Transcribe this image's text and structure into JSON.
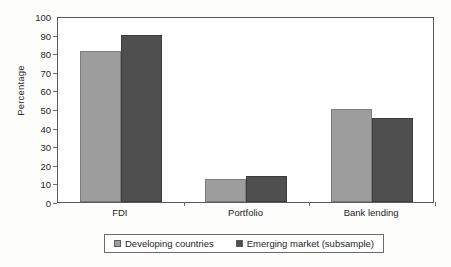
{
  "chart_data": {
    "type": "bar",
    "title": "",
    "subtitle": "",
    "xlabel": "",
    "ylabel": "Percentage",
    "categories": [
      "FDI",
      "Portfolio",
      "Bank lending"
    ],
    "series": [
      {
        "name": "Developing countries",
        "color": "#9d9d9d",
        "values": [
          81,
          12.5,
          50
        ]
      },
      {
        "name": "Emerging market (subsample)",
        "color": "#4f4f4f",
        "values": [
          90,
          14,
          45
        ]
      }
    ],
    "ylim": [
      0,
      100
    ],
    "ytick_step": 10,
    "yticks": [
      0,
      10,
      20,
      30,
      40,
      50,
      60,
      70,
      80,
      90,
      100
    ],
    "grid": false,
    "legend_position": "bottom",
    "frame": true
  },
  "legend": {
    "items": [
      {
        "label": "Developing countries",
        "color": "#9d9d9d"
      },
      {
        "label": "Emerging market (subsample)",
        "color": "#4f4f4f"
      }
    ]
  },
  "colors": {
    "series_light": "#9d9d9d",
    "series_dark": "#4f4f4f",
    "axis": "#5a5a5a",
    "text": "#1e1e1e",
    "background": "#fdfdfc",
    "plot_background": "#ffffff"
  }
}
